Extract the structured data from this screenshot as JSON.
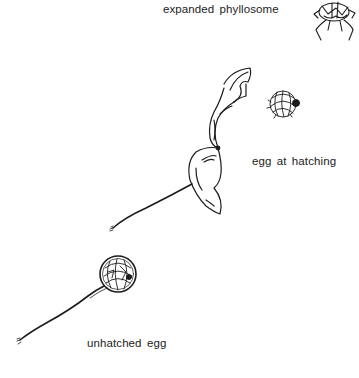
{
  "figure": {
    "labels": {
      "expanded_phyllosome": "expanded phyllosome",
      "egg_at_hatching": "egg at hatching",
      "unhatched_egg": "unhatched egg"
    },
    "stages": [
      {
        "id": "unhatched-egg",
        "label": "unhatched egg",
        "description": "spherical egg with coiled embryo on long stalk"
      },
      {
        "id": "egg-at-hatching",
        "label": "egg at hatching",
        "description": "ruptured, unfolding egg membrane on stalk with released coiled larva"
      },
      {
        "id": "expanded-phyllosome",
        "label": "expanded phyllosome",
        "description": "flattened larva with spreading legs"
      }
    ],
    "colors": {
      "ink": "#1c1c1c",
      "background": "#ffffff"
    }
  }
}
